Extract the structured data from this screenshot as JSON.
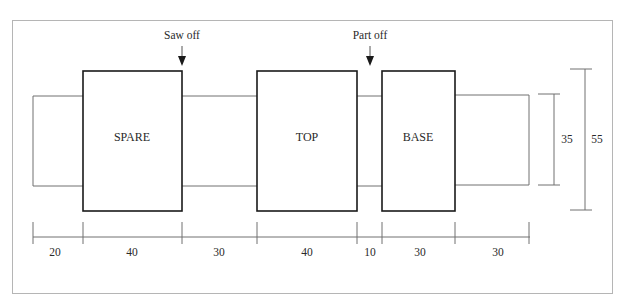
{
  "diagram": {
    "labels": {
      "saw_off": "Saw off",
      "part_off": "Part off"
    },
    "sections": [
      {
        "name": "SPARE",
        "label": "SPARE"
      },
      {
        "name": "TOP",
        "label": "TOP"
      },
      {
        "name": "BASE",
        "label": "BASE"
      }
    ],
    "horizontal_dimensions": [
      "20",
      "40",
      "30",
      "40",
      "10",
      "30",
      "30"
    ],
    "vertical_dimensions": {
      "shaft_diameter": "35",
      "section_diameter": "55"
    },
    "colors": {
      "heavy_line": "#1a1a1a",
      "thin_line": "#6b6b6b",
      "border": "#b0b0b0"
    }
  }
}
